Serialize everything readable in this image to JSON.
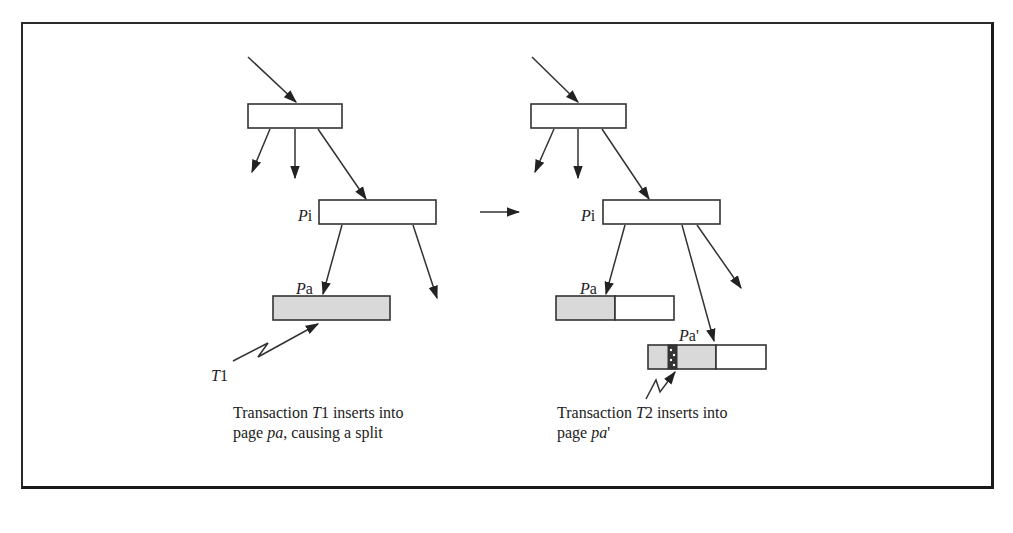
{
  "diagram": {
    "left_panel": {
      "node_pi_label_italic": "P",
      "node_pi_label_rest": "i",
      "node_pa_label_italic": "P",
      "node_pa_label_rest": "a",
      "transaction_label_italic": "T",
      "transaction_label_rest": "1",
      "caption_line1_prefix": "Transaction ",
      "caption_line1_italic": "T",
      "caption_line1_suffix": "1 inserts into",
      "caption_line2_prefix": "page ",
      "caption_line2_italic": "pa",
      "caption_line2_suffix": ", causing a split"
    },
    "right_panel": {
      "node_pi_label_italic": "P",
      "node_pi_label_rest": "i",
      "node_pa_label_italic": "P",
      "node_pa_label_rest": "a",
      "node_pa_prime_label_italic": "P",
      "node_pa_prime_label_rest": "a'",
      "caption_line1_prefix": "Transaction ",
      "caption_line1_italic": "T",
      "caption_line1_suffix": "2 inserts into",
      "caption_line2_prefix": "page ",
      "caption_line2_italic": "pa",
      "caption_line2_suffix": "'"
    },
    "transition_arrow": "right-arrow",
    "colors": {
      "ink": "#333333",
      "shaded_page": "#d9d9d9",
      "background": "#ffffff"
    }
  }
}
